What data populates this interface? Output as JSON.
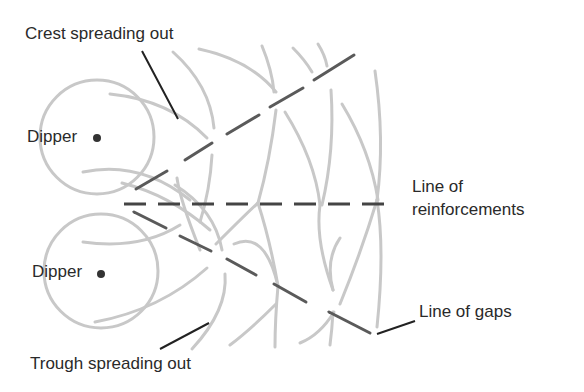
{
  "diagram": {
    "labels": {
      "crest": "Crest spreading out",
      "dipper_top": "Dipper",
      "dipper_bottom": "Dipper",
      "reinforce_line1": "Line of",
      "reinforce_line2": "reinforcements",
      "gaps": "Line of gaps",
      "trough": "Trough spreading out"
    },
    "colors": {
      "wave": "#c8c8c8",
      "line": "#555555",
      "leader": "#222222",
      "text": "#2a2a2a"
    }
  }
}
